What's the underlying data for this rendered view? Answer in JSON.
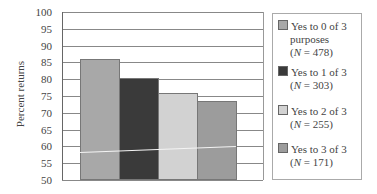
{
  "chart_data": {
    "type": "bar",
    "title": "",
    "xlabel": "",
    "ylabel": "Percent returns",
    "ylim": [
      50,
      100
    ],
    "yticks": [
      100,
      95,
      90,
      85,
      80,
      75,
      70,
      65,
      60,
      55,
      50
    ],
    "grid": true,
    "legend_position": "right",
    "categories": [
      ""
    ],
    "series": [
      {
        "name": "Yes to 0 of 3 purposes (N = 478)",
        "values": [
          86
        ],
        "color": "#a8a8a8"
      },
      {
        "name": "Yes to 1 of 3 (N = 303)",
        "values": [
          80.5
        ],
        "color": "#3a3a3a"
      },
      {
        "name": "Yes to 2 of 3 (N = 255)",
        "values": [
          76
        ],
        "color": "#d2d2d2"
      },
      {
        "name": "Yes to 3 of 3 (N = 171)",
        "values": [
          73.5
        ],
        "color": "#9c9c9c"
      }
    ]
  },
  "axis": {
    "ylabel": "Percent returns",
    "ticks": [
      "100",
      "95",
      "90",
      "85",
      "80",
      "75",
      "70",
      "65",
      "60",
      "55",
      "50"
    ]
  },
  "legend": [
    {
      "line1": "Yes to 0 of 3",
      "line2": "purposes",
      "n_label": "N",
      "n_value": " = 478)"
    },
    {
      "line1": "Yes to 1 of 3",
      "n_label": "N",
      "n_value": " = 303)"
    },
    {
      "line1": "Yes to 2 of 3",
      "n_label": "N",
      "n_value": " = 255)"
    },
    {
      "line1": "Yes to 3 of 3",
      "n_label": "N",
      "n_value": " = 171)"
    }
  ],
  "paren_open": "("
}
